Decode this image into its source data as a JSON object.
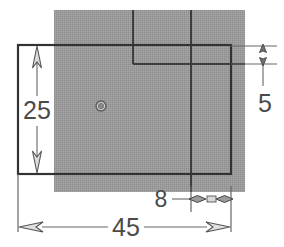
{
  "drawing": {
    "type": "orthographic-part-view",
    "background_color": "#ffffff",
    "body_fill_color": "#9a9a9a",
    "line_color": "#3a3a3a",
    "dimension_line_color": "#5a5a5a",
    "text_color": "#4a4a4a",
    "units_implied": "mm"
  },
  "part_body": {
    "name": "hatched-body-rectangle",
    "x": 54,
    "y": 10,
    "width": 191,
    "height": 182
  },
  "outline": {
    "name": "part-outline-rectangle",
    "x": 18,
    "y": 45,
    "width": 213,
    "height": 129
  },
  "construction_lines": [
    {
      "name": "step-horizontal-line",
      "x1": 133,
      "y1": 64,
      "x2": 245,
      "y2": 64
    },
    {
      "name": "step-vertical-line-left",
      "x1": 133,
      "y1": 10,
      "x2": 133,
      "y2": 64
    },
    {
      "name": "step-vertical-line-right",
      "x1": 191,
      "y1": 10,
      "x2": 191,
      "y2": 192
    }
  ],
  "hole": {
    "name": "center-hole",
    "cx": 101,
    "cy": 106,
    "outer_r": 5.0,
    "inner_r": 2.6
  },
  "dimensions": [
    {
      "id": "height-25",
      "label": "25",
      "orientation": "vertical",
      "value": 25,
      "text_x": 37,
      "text_y": 118,
      "line_x": 37,
      "line_y1": 49,
      "line_y2": 171,
      "ext_y1": 45,
      "ext_y2": 174,
      "arrow_direction": "outward",
      "description": "overall height of outline rectangle"
    },
    {
      "id": "height-5",
      "label": "5",
      "orientation": "vertical",
      "value": 5,
      "text_x": 266,
      "text_y": 110,
      "line_x": 263,
      "line_y1": 46,
      "line_y2": 64,
      "ext_x1": 231,
      "ext_x2": 277,
      "ext_line_y_top": 46,
      "ext_line_y_bottom": 64,
      "arrow_direction": "inward",
      "description": "step height at right edge"
    },
    {
      "id": "width-8",
      "label": "8",
      "orientation": "horizontal",
      "value": 8,
      "text_x": 160,
      "text_y": 207,
      "line_y": 199,
      "line_x1": 191,
      "line_x2": 231,
      "leader_x1": 172,
      "leader_x2": 191,
      "arrow_direction": "inward",
      "description": "width of right step region"
    },
    {
      "id": "width-45",
      "label": "45",
      "orientation": "horizontal",
      "value": 45,
      "text_x": 125,
      "text_y": 234,
      "line_y": 227,
      "line_x1": 18,
      "line_x2": 231,
      "ext_x_left": 18,
      "ext_x_right": 231,
      "ext_y_top": 174,
      "ext_y_bottom": 232,
      "arrow_direction": "outward",
      "description": "overall width of outline rectangle"
    }
  ]
}
